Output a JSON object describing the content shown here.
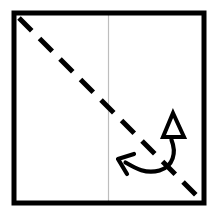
{
  "meta": {
    "title": "Origami Fold Step Diagram",
    "canvas_width": 209,
    "canvas_height": 218,
    "background_color": "#ffffff"
  },
  "colors": {
    "paper_border": "#000000",
    "paper_fill": "#ffffff",
    "crease_line": "#bdbdbd",
    "fold_line": "#000000",
    "arrow": "#000000"
  },
  "paper": {
    "label": "square-paper",
    "x": 14,
    "y": 13,
    "width": 190,
    "height": 190,
    "stroke_width": 5,
    "stroke_color": "#000000",
    "fill_color": "#ffffff"
  },
  "existing_crease": {
    "label": "vertical-center-crease",
    "x1": 108.5,
    "y1": 15,
    "x2": 108.5,
    "y2": 201,
    "stroke_color": "#bdbdbd",
    "stroke_width": 1.2,
    "style": "solid"
  },
  "fold_line": {
    "label": "diagonal-valley-fold",
    "x1": 19,
    "y1": 18,
    "x2": 199,
    "y2": 198,
    "stroke_color": "#000000",
    "stroke_width": 5,
    "style": "dashed",
    "dash_length": 18,
    "gap_length": 11,
    "linecap": "butt"
  },
  "fold_arrow": {
    "label": "fold-and-unfold-arrow",
    "stroke_color": "#000000",
    "stroke_width": 4.2,
    "curve_path": "M 171.5 140 C 176 152 174 166 160 170 C 146 174 136 168 126 163",
    "triangle_arrowhead": {
      "label": "hollow-triangle-arrowhead-up",
      "apex_x": 173,
      "apex_y": 113,
      "base_left_x": 163,
      "base_left_y": 137,
      "base_right_x": 184,
      "base_right_y": 137,
      "fill": "#ffffff",
      "stroke": "#000000",
      "stroke_width": 4
    },
    "barb_arrowhead": {
      "label": "open-barb-arrowhead-left",
      "tip_x": 118,
      "tip_y": 159,
      "upper_barb_x": 134,
      "upper_barb_y": 154,
      "lower_barb_x": 127,
      "lower_barb_y": 174,
      "stroke": "#000000",
      "stroke_width": 4.2
    }
  }
}
